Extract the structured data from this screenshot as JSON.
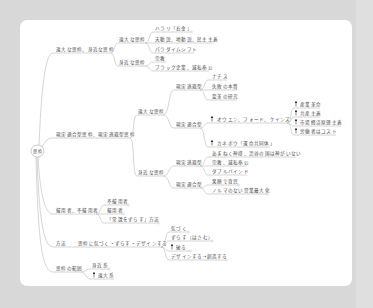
{
  "diagram": {
    "type": "mind-map"
  },
  "mindmap": {
    "root": {
      "label": "思枠"
    },
    "branches": [
      {
        "label": "遠大な思枠、身近な思枠",
        "children": [
          {
            "label": "遠大な思枠",
            "children": [
              {
                "label": "ハラリ「お金」",
                "collapsed_marker": true
              },
              {
                "label": "天動説、地動説、民主主義"
              },
              {
                "label": "パラダイムシフト"
              }
            ]
          },
          {
            "label": "身近な思枠",
            "children": [
              {
                "label": "宗教"
              },
              {
                "label": "ブラック企業、滅私奉公"
              }
            ]
          }
        ]
      },
      {
        "label": "現実適合型思枠、現実逃避型思枠",
        "children": [
          {
            "label": "遠大な思枠",
            "children": [
              {
                "label": "現実逃避型",
                "children": [
                  {
                    "label": "ナチス"
                  },
                  {
                    "label": "失敗の本質"
                  },
                  {
                    "label": "変革の研究"
                  }
                ]
              },
              {
                "label": "現実適合型",
                "children": [
                  {
                    "label": "オウエン、フォード、ケインズ",
                    "icon": "pin-icon",
                    "children": [
                      {
                        "label": "産業革命",
                        "icon": "pin-icon"
                      },
                      {
                        "label": "共産主義",
                        "icon": "pin-icon"
                      },
                      {
                        "label": "市場経済原理主義",
                        "icon": "pin-icon"
                      },
                      {
                        "label": "労働者はコスト",
                        "icon": "pin-icon"
                      }
                    ]
                  },
                  {
                    "label": "カネボウ「運命共同体」",
                    "icon": "pin-icon"
                  }
                ]
              }
            ]
          },
          {
            "label": "身近な思枠",
            "children": [
              {
                "label": "現実逃避型",
                "children": [
                  {
                    "label": "あまねく神様、渋谷の国は神がいない"
                  },
                  {
                    "label": "宗教、滅私奉公"
                  },
                  {
                    "label": "ダブルバインド"
                  }
                ]
              },
              {
                "label": "現実適合型",
                "children": [
                  {
                    "label": "笑顔で育児",
                    "collapsed_marker": true
                  },
                  {
                    "label": "ノルマのない営業最大化",
                    "collapsed_marker": true
                  }
                ]
              }
            ]
          }
        ]
      },
      {
        "label": "擬用者、不擬用者",
        "children": [
          {
            "label": "不擬用者",
            "collapsed_marker": true
          },
          {
            "label": "擬用者",
            "collapsed_marker": true
          },
          {
            "label": "「常識をずらす」方法",
            "collapsed_marker": true
          }
        ]
      },
      {
        "label": "方法",
        "children": [
          {
            "label": "思枠に気づく・ずらす・デザインする",
            "children": [
              {
                "label": "気づく",
                "collapsed_marker": true
              },
              {
                "label": "ずらす（はさむ）",
                "collapsed_marker": true
              },
              {
                "label": "破る",
                "icon": "pin-icon",
                "collapsed_marker": true
              },
              {
                "label": "デザインする→創造する",
                "collapsed_marker": true
              }
            ]
          }
        ]
      },
      {
        "label": "思枠の範囲",
        "children": [
          {
            "label": "身近系",
            "collapsed_marker": true
          },
          {
            "label": "遠大系",
            "icon": "pin-icon"
          }
        ]
      }
    ]
  },
  "colors": {
    "background": "#d8d8d8",
    "card": "#ffffff",
    "line": "#b8b8b8",
    "text": "#4a4a4a",
    "icon": "#333333"
  }
}
